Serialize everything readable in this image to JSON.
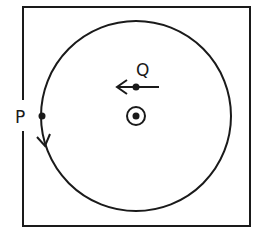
{
  "diagram": {
    "type": "physics-field-diagram",
    "colors": {
      "stroke": "#1a1a1a",
      "background": "#ffffff"
    },
    "labels": {
      "p": "P",
      "q": "Q"
    },
    "elements": {
      "field_region": "square boundary",
      "path": "circular orbit",
      "field_symbol": "dot-in-circle (out of page)",
      "point_p": "on circle left edge, arrow pointing downward along path",
      "point_q": "above center, velocity arrow pointing left"
    }
  }
}
